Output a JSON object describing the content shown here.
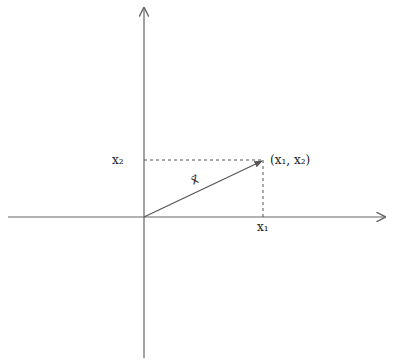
{
  "diagram": {
    "type": "vector-in-plane",
    "colors": {
      "axis": "#666666",
      "vector": "#555555",
      "dashed": "#555555",
      "text": "#222222",
      "background": "#ffffff"
    },
    "axes": {
      "origin": [
        144,
        217
      ],
      "horizontal": {
        "from": [
          8,
          217
        ],
        "to": [
          385,
          217
        ]
      },
      "vertical": {
        "from": [
          144,
          358
        ],
        "to": [
          144,
          8
        ]
      }
    },
    "vector": {
      "from": [
        144,
        217
      ],
      "to": [
        263,
        160
      ],
      "label": "x⃗"
    },
    "point": {
      "label": "(x₁, x₂)",
      "position": [
        263,
        160
      ]
    },
    "labels": {
      "x1_axis": "x₁",
      "x2_axis": "x₂"
    }
  }
}
